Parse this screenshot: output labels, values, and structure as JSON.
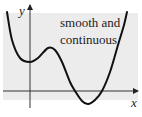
{
  "chart_data": {
    "type": "line",
    "title": "",
    "annotation": [
      "smooth and",
      "continuous"
    ],
    "xlabel": "x",
    "ylabel": "y",
    "grid": false,
    "legend": null,
    "series": [
      {
        "name": "f(x)",
        "points_px": [
          [
            7,
            12
          ],
          [
            12,
            40
          ],
          [
            20,
            58
          ],
          [
            30,
            62
          ],
          [
            38,
            58
          ],
          [
            48,
            48
          ],
          [
            55,
            50
          ],
          [
            62,
            62
          ],
          [
            70,
            82
          ],
          [
            75,
            91
          ],
          [
            82,
            101
          ],
          [
            88,
            104
          ],
          [
            95,
            100
          ],
          [
            102,
            91
          ],
          [
            110,
            72
          ],
          [
            118,
            45
          ],
          [
            124,
            25
          ],
          [
            127,
            12
          ]
        ]
      }
    ],
    "colors": {
      "curve": "#111111",
      "axes": "#333333",
      "panel": "#ececec"
    }
  },
  "labels": {
    "caption_line1": "smooth and",
    "caption_line2": "continuous",
    "y_axis": "y",
    "x_axis": "x"
  }
}
